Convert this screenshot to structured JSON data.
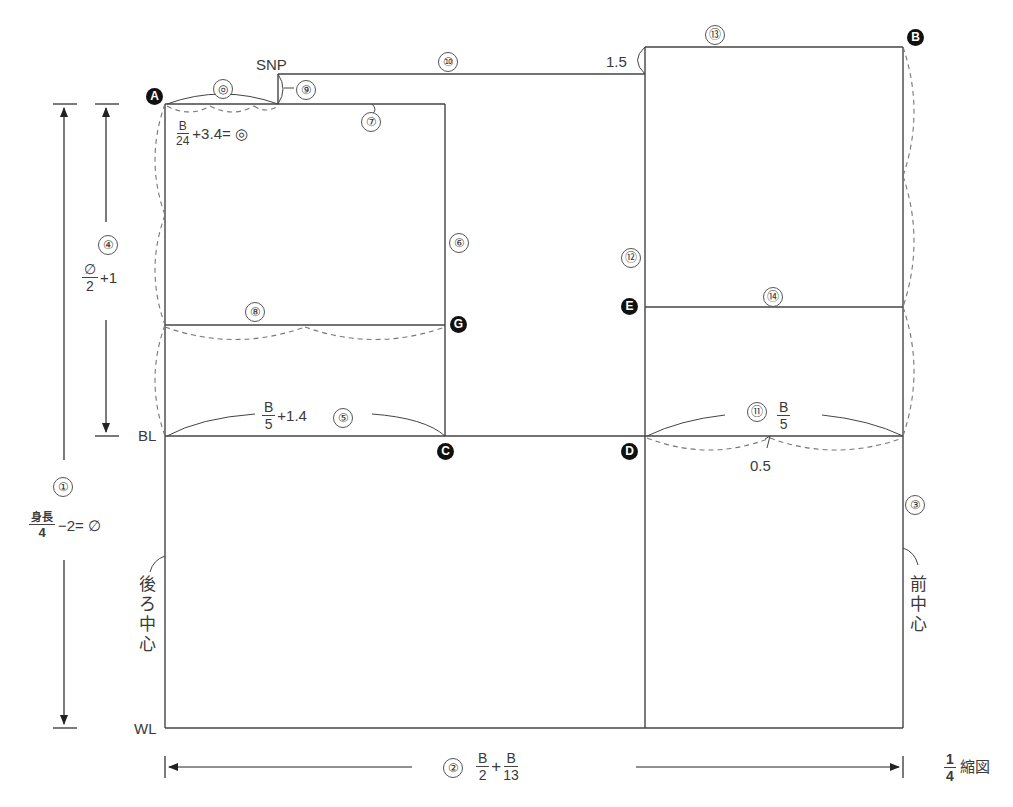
{
  "diagram": {
    "type": "sewing-pattern-draft",
    "scale_note": {
      "num": "1",
      "den": "4",
      "text": "縮図"
    },
    "points": {
      "A": "A",
      "B": "B",
      "C": "C",
      "D": "D",
      "E": "E",
      "G": "G"
    },
    "line_labels": {
      "SNP": "SNP",
      "BL": "BL",
      "WL": "WL",
      "back_center": [
        "後",
        "ろ",
        "中",
        "心"
      ],
      "front_center": [
        "前",
        "中",
        "心"
      ]
    },
    "steps": {
      "s1": "①",
      "s2": "②",
      "s3": "③",
      "s4": "④",
      "s5": "⑤",
      "s6": "⑥",
      "s7": "⑦",
      "s8": "⑧",
      "s9": "⑨",
      "s10": "⑩",
      "s11": "⑪",
      "s12": "⑫",
      "s13": "⑬",
      "s14": "⑭",
      "double_circle": "◎"
    },
    "formulas": {
      "f1": {
        "num": "身長",
        "den": "4",
        "rest": "−2= ∅"
      },
      "f2": {
        "a_num": "B",
        "a_den": "2",
        "plus": "+",
        "b_num": "B",
        "b_den": "13"
      },
      "f4": {
        "num": "∅",
        "den": "2",
        "rest": "+1"
      },
      "f5": {
        "num": "B",
        "den": "5",
        "rest": "+1.4"
      },
      "f11": {
        "num": "B",
        "den": "5"
      },
      "neck": {
        "num": "B",
        "den": "24",
        "rest": "+3.4= ◎"
      }
    },
    "measurements": {
      "shoulder_drop": "1.5",
      "front_dart": "0.5"
    }
  }
}
